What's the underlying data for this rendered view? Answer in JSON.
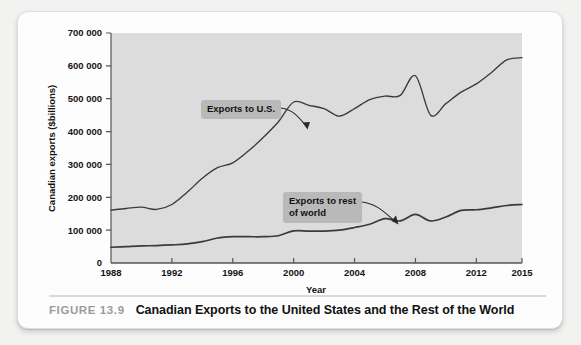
{
  "figure": {
    "number_label": "FIGURE 13.9",
    "title": "Canadian Exports to the United States and the Rest of the World"
  },
  "annotations": {
    "us_label": "Exports to U.S.",
    "row_label_line1": "Exports to rest",
    "row_label_line2": "of world"
  },
  "colors": {
    "card_background": "#fdfdfd",
    "plot_background": "#dcdcdc",
    "line": "#3a3a3a",
    "callout_background": "#b9b9b9",
    "caption_number": "#9b9b9b",
    "axis": "#555555"
  },
  "chart_data": {
    "type": "line",
    "title": "Canadian Exports to the United States and the Rest of the World",
    "xlabel": "Year",
    "ylabel": "Canadian exports ($billions)",
    "xlim": [
      1988,
      2015
    ],
    "ylim": [
      0,
      700000
    ],
    "grid": false,
    "legend": "none (inline annotated labels)",
    "xticks": [
      1988,
      1992,
      1996,
      2000,
      2004,
      2008,
      2012,
      2015
    ],
    "xticklabels": [
      "1988",
      "1992",
      "1996",
      "2000",
      "2004",
      "2008",
      "2012",
      "2015"
    ],
    "yticks": [
      0,
      100000,
      200000,
      300000,
      400000,
      500000,
      600000,
      700000
    ],
    "yticklabels": [
      "0",
      "100 000",
      "200 000",
      "300 000",
      "400 000",
      "500 000",
      "600 000",
      "700 000"
    ],
    "x": [
      1988,
      1989,
      1990,
      1991,
      1992,
      1993,
      1994,
      1995,
      1996,
      1997,
      1998,
      1999,
      2000,
      2001,
      2002,
      2003,
      2004,
      2005,
      2006,
      2007,
      2008,
      2009,
      2010,
      2011,
      2012,
      2013,
      2014,
      2015
    ],
    "series": [
      {
        "name": "Exports to U.S.",
        "values": [
          161000,
          166000,
          170000,
          163000,
          178000,
          215000,
          258000,
          290000,
          305000,
          340000,
          382000,
          430000,
          490000,
          480000,
          470000,
          447000,
          470000,
          497000,
          508000,
          510000,
          570000,
          450000,
          485000,
          520000,
          545000,
          580000,
          618000,
          625000
        ]
      },
      {
        "name": "Exports to rest of world",
        "values": [
          48000,
          50000,
          52000,
          53000,
          55000,
          58000,
          65000,
          76000,
          80000,
          80000,
          80000,
          83000,
          98000,
          97000,
          97000,
          100000,
          108000,
          118000,
          135000,
          128000,
          148000,
          128000,
          140000,
          160000,
          162000,
          168000,
          175000,
          178000
        ]
      }
    ]
  }
}
